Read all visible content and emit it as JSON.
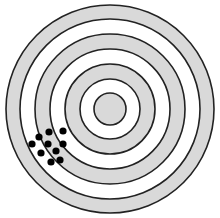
{
  "target": {
    "center": {
      "x": 110,
      "y": 109
    },
    "stroke_color": "#222222",
    "stroke_width": 1.6,
    "rings": [
      {
        "radius": 104,
        "fill": "#d9d9d9"
      },
      {
        "radius": 90,
        "fill": "#ffffff"
      },
      {
        "radius": 75,
        "fill": "#d9d9d9"
      },
      {
        "radius": 60,
        "fill": "#ffffff"
      },
      {
        "radius": 45,
        "fill": "#d9d9d9"
      },
      {
        "radius": 30,
        "fill": "#ffffff"
      },
      {
        "radius": 16,
        "fill": "#d9d9d9"
      }
    ]
  },
  "hits": {
    "color": "#000000",
    "radius": 3.6,
    "points": [
      {
        "x": 63,
        "y": 131
      },
      {
        "x": 49,
        "y": 132
      },
      {
        "x": 39,
        "y": 137
      },
      {
        "x": 32,
        "y": 144
      },
      {
        "x": 48,
        "y": 144
      },
      {
        "x": 63,
        "y": 144
      },
      {
        "x": 56,
        "y": 151
      },
      {
        "x": 41,
        "y": 153
      },
      {
        "x": 60,
        "y": 160
      },
      {
        "x": 51,
        "y": 162
      }
    ]
  }
}
